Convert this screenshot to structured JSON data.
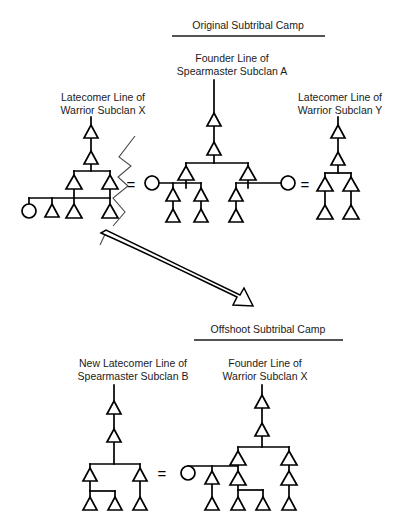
{
  "headers": [
    {
      "id": "original-camp",
      "text": "Original Subtribal Camp",
      "x": 248,
      "y": 29,
      "rule": {
        "x1": 172,
        "x2": 325,
        "y": 36
      }
    },
    {
      "id": "offshoot-camp",
      "text": "Offshoot Subtribal Camp",
      "x": 268,
      "y": 333,
      "rule": {
        "x1": 194,
        "x2": 343,
        "y": 340
      }
    }
  ],
  "captions": [
    {
      "id": "founder-line-spearmaster-a",
      "lines": [
        "Founder Line of",
        "Spearmaster Subclan A"
      ],
      "x": 232,
      "y": 62
    },
    {
      "id": "latecomer-line-warrior-x",
      "lines": [
        "Latecomer Line of",
        "Warrior Subclan X"
      ],
      "x": 103,
      "y": 101
    },
    {
      "id": "latecomer-line-warrior-y",
      "lines": [
        "Latecomer Line of",
        "Warrior Subclan Y"
      ],
      "x": 340,
      "y": 101
    },
    {
      "id": "new-latecomer-line-spearmaster-b",
      "lines": [
        "New Latecomer Line of",
        "Spearmaster Subclan B"
      ],
      "x": 133,
      "y": 367
    },
    {
      "id": "founder-line-warrior-x",
      "lines": [
        "Founder Line of",
        "Warrior Subclan X"
      ],
      "x": 265,
      "y": 367
    }
  ],
  "equals_signs": [
    {
      "id": "marriage-eq-top-left",
      "text": "=",
      "x": 131,
      "y": 186
    },
    {
      "id": "marriage-eq-top-right",
      "text": "=",
      "x": 305,
      "y": 186
    },
    {
      "id": "marriage-eq-bottom",
      "text": "=",
      "x": 162,
      "y": 474
    }
  ],
  "colors": {
    "line": "#000000",
    "text": "#1a1a1a",
    "symbol_fill": "#ffffff",
    "break_line": "#4a4a4a",
    "background": "#ffffff"
  },
  "symbols": {
    "male_glyph": "triangle",
    "female_glyph": "circle",
    "marriage_glyph": "equals-sign",
    "descent_glyph": "vertical-line"
  },
  "diagram_data": {
    "type": "kinship-genealogy",
    "description": "Dinka-style subtribal camp fission diagram showing descent lines of spearmaster and warrior subclans before and after an offshoot camp forms.",
    "groups": [
      {
        "id": "top-left-warrior-x",
        "caption_id": "latecomer-line-warrior-x",
        "member_count": 8,
        "males": 7,
        "females": 1
      },
      {
        "id": "top-center-spearmaster-a",
        "caption_id": "founder-line-spearmaster-a",
        "member_count": 11,
        "males": 9,
        "females": 2
      },
      {
        "id": "top-right-warrior-y",
        "caption_id": "latecomer-line-warrior-y",
        "member_count": 6,
        "males": 6,
        "females": 0
      },
      {
        "id": "bottom-left-spearmaster-b",
        "caption_id": "new-latecomer-line-spearmaster-b",
        "member_count": 7,
        "males": 7,
        "females": 0
      },
      {
        "id": "bottom-right-warrior-x",
        "caption_id": "founder-line-warrior-x",
        "member_count": 12,
        "males": 11,
        "females": 1
      }
    ]
  },
  "geometry": {
    "triangles_top_left": [
      {
        "id": "tl-a1",
        "x": 91,
        "y": 133
      },
      {
        "id": "tl-a2",
        "x": 91,
        "y": 159
      },
      {
        "id": "tl-b1",
        "x": 74,
        "y": 183
      },
      {
        "id": "tl-b2",
        "x": 110,
        "y": 183
      },
      {
        "id": "tl-c1",
        "x": 52,
        "y": 210
      },
      {
        "id": "tl-c2",
        "x": 74,
        "y": 210
      },
      {
        "id": "tl-c3",
        "x": 110,
        "y": 210
      }
    ],
    "circles_top_left": [
      {
        "id": "tl-f1",
        "x": 29,
        "y": 210
      }
    ],
    "triangles_top_center": [
      {
        "id": "tc-a1",
        "x": 214,
        "y": 121
      },
      {
        "id": "tc-a2",
        "x": 214,
        "y": 150
      },
      {
        "id": "tc-b1",
        "x": 186,
        "y": 174
      },
      {
        "id": "tc-b2",
        "x": 248,
        "y": 174
      },
      {
        "id": "tc-c1",
        "x": 173,
        "y": 195
      },
      {
        "id": "tc-c2",
        "x": 201,
        "y": 195
      },
      {
        "id": "tc-c3",
        "x": 236,
        "y": 195
      },
      {
        "id": "tc-d1",
        "x": 173,
        "y": 216
      },
      {
        "id": "tc-d2",
        "x": 201,
        "y": 216
      },
      {
        "id": "tc-d3",
        "x": 236,
        "y": 216
      }
    ],
    "circles_top_center": [
      {
        "id": "tc-f1",
        "x": 152,
        "y": 182
      },
      {
        "id": "tc-f2",
        "x": 288,
        "y": 182
      }
    ],
    "triangles_top_right": [
      {
        "id": "tr-a1",
        "x": 338,
        "y": 133
      },
      {
        "id": "tr-a2",
        "x": 338,
        "y": 160
      },
      {
        "id": "tr-b1",
        "x": 325,
        "y": 184
      },
      {
        "id": "tr-b2",
        "x": 351,
        "y": 184
      },
      {
        "id": "tr-c1",
        "x": 325,
        "y": 212
      },
      {
        "id": "tr-c2",
        "x": 351,
        "y": 212
      }
    ],
    "triangles_bottom_left": [
      {
        "id": "bl-a1",
        "x": 114,
        "y": 409
      },
      {
        "id": "bl-a2",
        "x": 114,
        "y": 437
      },
      {
        "id": "bl-b1",
        "x": 90,
        "y": 475
      },
      {
        "id": "bl-b2",
        "x": 140,
        "y": 475
      },
      {
        "id": "bl-c1",
        "x": 90,
        "y": 504
      },
      {
        "id": "bl-c2",
        "x": 115,
        "y": 504
      },
      {
        "id": "bl-c3",
        "x": 140,
        "y": 504
      }
    ],
    "triangles_bottom_right": [
      {
        "id": "br-a1",
        "x": 262,
        "y": 403
      },
      {
        "id": "br-a2",
        "x": 262,
        "y": 431
      },
      {
        "id": "br-b1",
        "x": 238,
        "y": 458
      },
      {
        "id": "br-b2",
        "x": 289,
        "y": 458
      },
      {
        "id": "br-c1",
        "x": 212,
        "y": 478
      },
      {
        "id": "br-c2",
        "x": 238,
        "y": 478
      },
      {
        "id": "br-c3",
        "x": 289,
        "y": 478
      },
      {
        "id": "br-d1",
        "x": 212,
        "y": 504
      },
      {
        "id": "br-d2",
        "x": 238,
        "y": 504
      },
      {
        "id": "br-d3",
        "x": 263,
        "y": 504
      },
      {
        "id": "br-d4",
        "x": 289,
        "y": 504
      }
    ],
    "circles_bottom_right": [
      {
        "id": "br-f1",
        "x": 188,
        "y": 478
      }
    ]
  }
}
